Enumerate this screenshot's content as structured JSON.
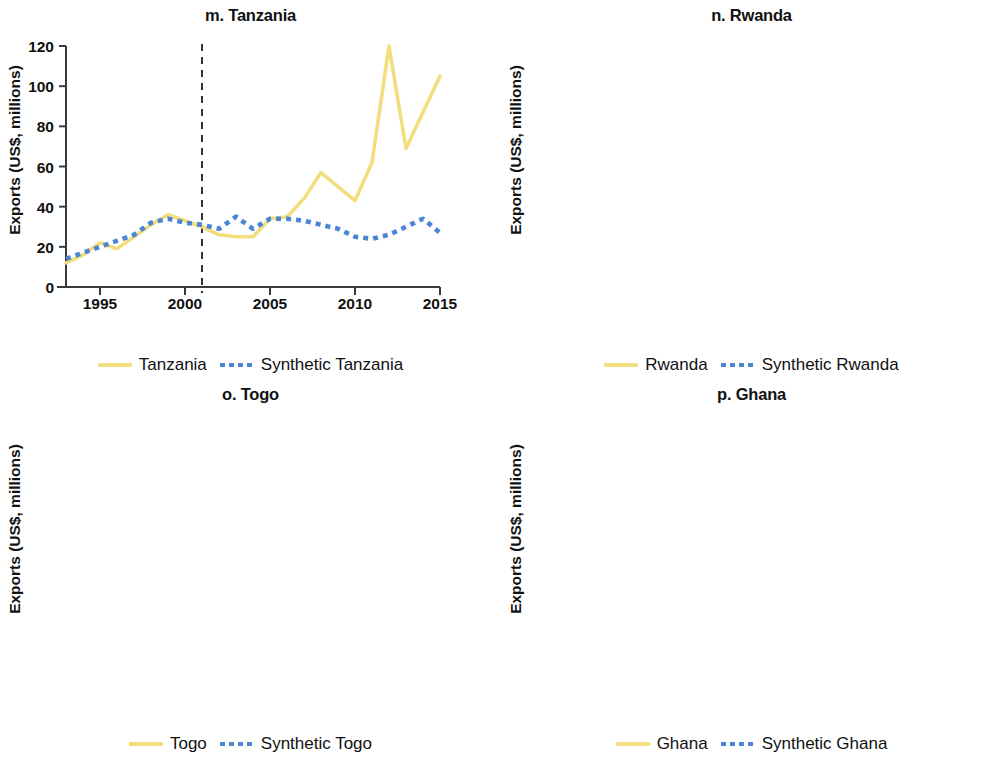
{
  "figure": {
    "panel_count": 4,
    "series_colors": {
      "treated": "#f2de7e",
      "synthetic": "#4a86d4"
    },
    "axis_color": "#3a3a3a",
    "intervention_line_color": "#333333"
  },
  "panels": [
    {
      "key": "tanzania",
      "title": "m. Tanzania",
      "ylabel": "Exports (US$, millions)",
      "legend": {
        "treated": "Tanzania",
        "synthetic": "Synthetic Tanzania"
      },
      "chart_data": {
        "type": "line",
        "title": "m. Tanzania",
        "xlabel": "",
        "ylabel": "Exports (US$, millions)",
        "xlim": [
          1993,
          2015
        ],
        "ylim": [
          0,
          120
        ],
        "yticks": [
          0,
          20,
          40,
          60,
          80,
          100,
          120
        ],
        "xticks": [
          1995,
          2000,
          2005,
          2010,
          2015
        ],
        "grid": false,
        "legend_position": "below",
        "intervention_year": 2001,
        "x": [
          1993,
          1994,
          1995,
          1996,
          1997,
          1998,
          1999,
          2000,
          2001,
          2002,
          2003,
          2004,
          2005,
          2006,
          2007,
          2008,
          2009,
          2010,
          2011,
          2012,
          2013,
          2014,
          2015
        ],
        "series": [
          {
            "name": "Tanzania",
            "style": "solid",
            "color": "#f2de7e",
            "values": [
              12,
              16,
              22,
              19,
              25,
              31,
              36,
              33,
              30,
              26,
              25,
              25,
              34,
              35,
              44,
              57,
              50,
              43,
              62,
              120,
              69,
              87,
              105
            ]
          },
          {
            "name": "Synthetic Tanzania",
            "style": "dotted",
            "color": "#4a86d4",
            "values": [
              14,
              17,
              20,
              23,
              26,
              32,
              34,
              32,
              31,
              29,
              35,
              29,
              34,
              34,
              33,
              31,
              29,
              25,
              24,
              26,
              30,
              34,
              27
            ]
          }
        ]
      }
    },
    {
      "key": "rwanda",
      "title": "n. Rwanda",
      "ylabel": "Exports (US$, millions)",
      "legend": {
        "treated": "Rwanda",
        "synthetic": "Synthetic Rwanda"
      },
      "chart_data": {
        "type": "line",
        "title": "n. Rwanda",
        "xlabel": "",
        "ylabel": "Exports (US$, millions)",
        "xlim": [
          1993,
          2015
        ],
        "ylim": [
          0,
          40
        ],
        "yticks": [
          0,
          10,
          20,
          30,
          40
        ],
        "xticks": [
          1995,
          2000,
          2005,
          2010,
          2015
        ],
        "grid": false,
        "legend_position": "below",
        "intervention_year": 2001,
        "x": [
          1993,
          1994,
          1995,
          1996,
          1997,
          1998,
          1999,
          2000,
          2001,
          2002,
          2003,
          2004,
          2005,
          2006,
          2007,
          2008,
          2009,
          2010,
          2011,
          2012,
          2013,
          2014,
          2015
        ],
        "series": [
          {
            "name": "Rwanda",
            "style": "solid",
            "color": "#f2de7e",
            "values": [
              4.3,
              1.7,
              2.0,
              9.0,
              4.2,
              4.4,
              4.1,
              5.0,
              7.0,
              3.7,
              3.0,
              5.3,
              5.8,
              7.5,
              10.8,
              10.3,
              15.8,
              17.0,
              22.3,
              23.8,
              17.0,
              29.5,
              36.3
            ]
          },
          {
            "name": "Synthetic Rwanda",
            "style": "dotted",
            "color": "#4a86d4",
            "values": [
              4.4,
              3.8,
              3.7,
              4.7,
              6.1,
              6.0,
              6.3,
              7.4,
              7.2,
              8.0,
              6.5,
              5.5,
              5.2,
              4.5,
              4.6,
              4.0,
              3.1,
              1.8,
              2.2,
              1.9,
              1.5,
              2.2,
              4.7
            ]
          }
        ]
      }
    },
    {
      "key": "togo",
      "title": "o. Togo",
      "ylabel": "Exports (US$, millions)",
      "legend": {
        "treated": "Togo",
        "synthetic": "Synthetic Togo"
      },
      "chart_data": {
        "type": "line",
        "title": "o. Togo",
        "xlabel": "",
        "ylabel": "Exports (US$, millions)",
        "xlim": [
          1993,
          2015
        ],
        "ylim": [
          0,
          40
        ],
        "yticks": [
          0,
          10,
          20,
          30,
          40
        ],
        "xticks": [
          1995,
          2000,
          2005,
          2010,
          2015
        ],
        "grid": false,
        "legend_position": "below",
        "intervention_year": 2008,
        "x": [
          1993,
          1994,
          1995,
          1996,
          1997,
          1998,
          1999,
          2000,
          2001,
          2002,
          2003,
          2004,
          2005,
          2006,
          2007,
          2008,
          2009,
          2010,
          2011,
          2012,
          2013,
          2014,
          2015
        ],
        "series": [
          {
            "name": "Togo",
            "style": "solid",
            "color": "#f2de7e",
            "values": [
              3.8,
              4.2,
              3.4,
              4.6,
              9.8,
              2.2,
              4.7,
              6.8,
              13.6,
              4.1,
              6.2,
              1.4,
              5.3,
              4.2,
              3.3,
              8.3,
              6.0,
              7.2,
              20.0,
              38.8,
              5.8,
              6.8,
              11.3
            ]
          },
          {
            "name": "Synthetic Togo",
            "style": "dotted",
            "color": "#4a86d4",
            "values": [
              3.3,
              4.0,
              3.6,
              3.9,
              4.5,
              5.1,
              6.2,
              6.5,
              5.8,
              4.2,
              5.2,
              4.9,
              5.1,
              5.5,
              5.1,
              4.4,
              4.4,
              4.6,
              4.1,
              3.1,
              3.3,
              4.0,
              4.4
            ]
          }
        ]
      }
    },
    {
      "key": "ghana",
      "title": "p. Ghana",
      "ylabel": "Exports (US$, millions)",
      "legend": {
        "treated": "Ghana",
        "synthetic": "Synthetic Ghana"
      },
      "chart_data": {
        "type": "line",
        "title": "p. Ghana",
        "xlabel": "",
        "ylabel": "Exports (US$, millions)",
        "xlim": [
          1993,
          2015
        ],
        "ylim": [
          0,
          600
        ],
        "yticks": [
          0,
          100,
          200,
          300,
          400,
          500,
          600
        ],
        "xticks": [
          1995,
          2000,
          2005,
          2010,
          2015
        ],
        "grid": false,
        "legend_position": "below",
        "intervention_year": 2001,
        "x": [
          1993,
          1994,
          1995,
          1996,
          1997,
          1998,
          1999,
          2000,
          2001,
          2002,
          2003,
          2004,
          2005,
          2006,
          2007,
          2008,
          2009,
          2010,
          2011,
          2012,
          2013,
          2014,
          2015
        ],
        "series": [
          {
            "name": "Ghana",
            "style": "solid",
            "color": "#f2de7e",
            "values": [
              228,
              210,
              190,
              160,
              158,
              155,
              225,
              208,
              200,
              135,
              86,
              145,
              148,
              175,
              168,
              168,
              117,
              195,
              588,
              207,
              268,
              196,
              247
            ]
          },
          {
            "name": "Synthetic Ghana",
            "style": "dotted",
            "color": "#4a86d4",
            "values": [
              196,
              192,
              180,
              168,
              167,
              182,
              203,
              215,
              208,
              211,
              228,
              220,
              215,
              175,
              165,
              167,
              152,
              178,
              200,
              124,
              108,
              107,
              120
            ]
          }
        ]
      }
    }
  ]
}
